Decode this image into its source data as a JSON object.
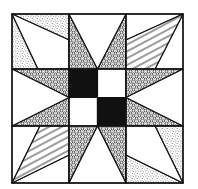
{
  "diagram": {
    "type": "quilt-block",
    "colors": {
      "background": "#ffffff",
      "ink": "#111111",
      "solid": "#111111"
    },
    "grid": {
      "lines": [
        12,
        69,
        126,
        183
      ],
      "mid": 97.5
    },
    "fabrics": {
      "circles": "circle-print",
      "stripes": "wavy-stripe",
      "stipple": "stipple",
      "solid": "solid-black",
      "plain": "white"
    },
    "cells": [
      {
        "position": "top-left",
        "pieces": [
          "stipple triangle top",
          "stipple triangle left",
          "white quad center"
        ]
      },
      {
        "position": "top-center",
        "pieces": [
          "circle-print star point left",
          "circle-print star point right",
          "white triangle"
        ]
      },
      {
        "position": "top-right",
        "pieces": [
          "white triangle top",
          "wavy-stripe quad",
          "white triangle right"
        ]
      },
      {
        "position": "middle-left",
        "pieces": [
          "circle-print star point top",
          "circle-print star point bottom",
          "white triangle"
        ]
      },
      {
        "position": "center",
        "pieces": [
          "solid black square TL",
          "white square TR",
          "white square BL",
          "solid black square BR"
        ]
      },
      {
        "position": "middle-right",
        "pieces": [
          "circle-print star point top",
          "circle-print star point bottom",
          "white triangle"
        ]
      },
      {
        "position": "bottom-left",
        "pieces": [
          "white triangle left",
          "wavy-stripe quad",
          "white triangle bottom"
        ]
      },
      {
        "position": "bottom-center",
        "pieces": [
          "circle-print star point left",
          "circle-print star point right",
          "white triangle"
        ]
      },
      {
        "position": "bottom-right",
        "pieces": [
          "stipple triangle right",
          "stipple triangle bottom",
          "white quad center"
        ]
      }
    ]
  }
}
